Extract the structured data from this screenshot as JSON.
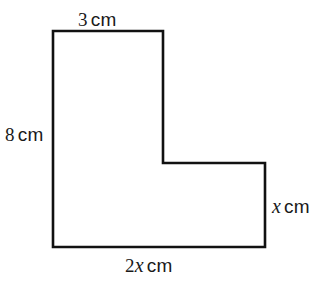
{
  "figure": {
    "type": "geometry-diagram",
    "shape_name": "l-shaped-polygon",
    "stroke_color": "#111111",
    "fill_color": "#ffffff",
    "background_color": "#ffffff",
    "stroke_width": 2.6,
    "vertices": [
      [
        53,
        31
      ],
      [
        163,
        31
      ],
      [
        163,
        163
      ],
      [
        265,
        163
      ],
      [
        265,
        247
      ],
      [
        53,
        247
      ]
    ],
    "labels": {
      "top": {
        "number": "3",
        "variable": "",
        "unit": "cm",
        "full": "3 cm"
      },
      "left": {
        "number": "8",
        "variable": "",
        "unit": "cm",
        "full": "8 cm"
      },
      "right": {
        "number": "",
        "variable": "x",
        "unit": "cm",
        "full": "x cm"
      },
      "bottom": {
        "number": "2",
        "variable": "x",
        "unit": "cm",
        "full": "2x cm"
      }
    }
  }
}
